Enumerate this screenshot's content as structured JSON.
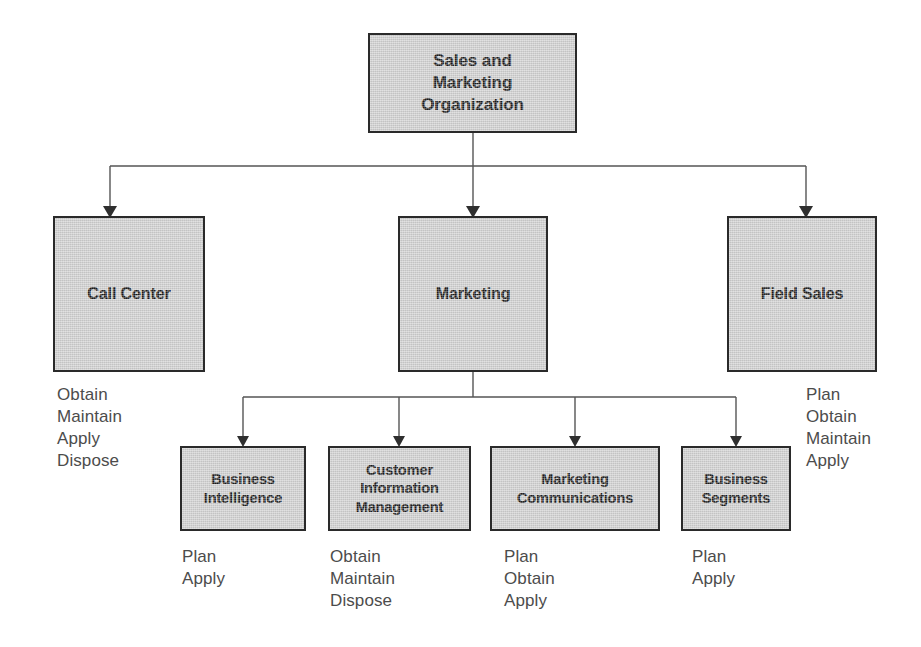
{
  "diagram": {
    "title_node": {
      "id": "sales-and-marketing-organization",
      "label": "Sales and\nMarketing\nOrganization"
    },
    "level2": [
      {
        "id": "call-center",
        "label": "Call Center",
        "verbs": "Obtain\nMaintain\nApply\nDispose"
      },
      {
        "id": "marketing",
        "label": "Marketing",
        "verbs": ""
      },
      {
        "id": "field-sales",
        "label": "Field Sales",
        "verbs": "Plan\nObtain\nMaintain\nApply"
      }
    ],
    "level3": [
      {
        "id": "business-intelligence",
        "label": "Business\nIntelligence",
        "verbs": "Plan\nApply"
      },
      {
        "id": "customer-information-management",
        "label": "Customer\nInformation\nManagement",
        "verbs": "Obtain\nMaintain\nDispose"
      },
      {
        "id": "marketing-communications",
        "label": "Marketing\nCommunications",
        "verbs": "Plan\nObtain\nApply"
      },
      {
        "id": "business-segments",
        "label": "Business\nSegments",
        "verbs": "Plan\nApply"
      }
    ],
    "colors": {
      "box_fill": "#cfcfcf",
      "box_border": "#2a2a2a",
      "connector": "#555555",
      "box_text": "#1b1b1b",
      "verb_text": "#4c4c4c",
      "background": "#ffffff"
    }
  }
}
